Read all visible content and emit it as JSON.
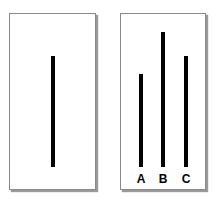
{
  "reference_card": {
    "line": {
      "name": "reference-line",
      "top": 55,
      "height": 111
    }
  },
  "comparison_card": {
    "lines": [
      {
        "label": "A",
        "top": 73,
        "height": 93
      },
      {
        "label": "B",
        "top": 31,
        "height": 135
      },
      {
        "label": "C",
        "top": 55,
        "height": 111
      }
    ]
  },
  "colors": {
    "line": "#000000",
    "card_border": "#8a8a8a",
    "background": "#ffffff"
  }
}
